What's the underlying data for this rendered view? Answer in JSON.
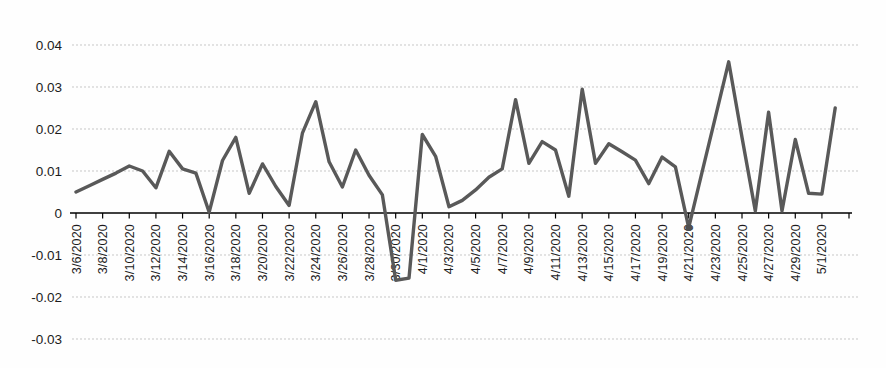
{
  "chart_data": {
    "type": "line",
    "title": "",
    "xlabel": "",
    "ylabel": "",
    "legend": "none",
    "grid": "horizontal-dashed",
    "line_color": "#595959",
    "axis_color": "#000000",
    "grid_color": "#c7c7c7",
    "ylim": [
      -0.03,
      0.04
    ],
    "y_tick_values": [
      0.04,
      0.03,
      0.02,
      0.01,
      0,
      -0.01,
      -0.02,
      -0.03
    ],
    "y_tick_labels": [
      "0.04",
      "0.03",
      "0.02",
      "0.01",
      "0",
      "-0.01",
      "-0.02",
      "-0.03"
    ],
    "x_tick_labels": [
      "3/6/2020",
      "3/8/2020",
      "3/10/2020",
      "3/12/2020",
      "3/14/2020",
      "3/16/2020",
      "3/18/2020",
      "3/20/2020",
      "3/22/2020",
      "3/24/2020",
      "3/26/2020",
      "3/28/2020",
      "3/30/2020",
      "4/1/2020",
      "4/3/2020",
      "4/5/2020",
      "4/7/2020",
      "4/9/2020",
      "4/11/2020",
      "4/13/2020",
      "4/15/2020",
      "4/17/2020",
      "4/19/2020",
      "4/21/2020",
      "4/23/2020",
      "4/25/2020",
      "4/27/2020",
      "4/29/2020",
      "5/1/2020"
    ],
    "x": [
      "3/6/2020",
      "3/7/2020",
      "3/8/2020",
      "3/9/2020",
      "3/10/2020",
      "3/11/2020",
      "3/12/2020",
      "3/13/2020",
      "3/14/2020",
      "3/15/2020",
      "3/16/2020",
      "3/17/2020",
      "3/18/2020",
      "3/19/2020",
      "3/20/2020",
      "3/21/2020",
      "3/22/2020",
      "3/23/2020",
      "3/24/2020",
      "3/25/2020",
      "3/26/2020",
      "3/27/2020",
      "3/28/2020",
      "3/29/2020",
      "3/30/2020",
      "3/31/2020",
      "4/1/2020",
      "4/2/2020",
      "4/3/2020",
      "4/4/2020",
      "4/5/2020",
      "4/6/2020",
      "4/7/2020",
      "4/8/2020",
      "4/9/2020",
      "4/10/2020",
      "4/11/2020",
      "4/12/2020",
      "4/13/2020",
      "4/14/2020",
      "4/15/2020",
      "4/16/2020",
      "4/17/2020",
      "4/18/2020",
      "4/19/2020",
      "4/20/2020",
      "4/21/2020",
      "4/22/2020",
      "4/23/2020",
      "4/24/2020",
      "4/25/2020",
      "4/26/2020",
      "4/27/2020",
      "4/28/2020",
      "4/29/2020",
      "4/30/2020",
      "5/1/2020",
      "5/2/2020"
    ],
    "values": [
      0.005,
      0.0065,
      0.008,
      0.0095,
      0.0112,
      0.01,
      0.006,
      0.0147,
      0.0105,
      0.0095,
      0.0002,
      0.0125,
      0.018,
      0.0047,
      0.0117,
      0.0063,
      0.0018,
      0.019,
      0.0265,
      0.0122,
      0.0062,
      0.015,
      0.009,
      0.0043,
      -0.016,
      -0.0155,
      0.0187,
      0.0135,
      0.0015,
      0.003,
      0.0055,
      0.0085,
      0.0105,
      0.027,
      0.0118,
      0.017,
      0.015,
      0.004,
      0.0295,
      0.0118,
      0.0165,
      0.0146,
      0.0126,
      0.007,
      0.0133,
      0.011,
      -0.0035,
      0.0097,
      0.0228,
      0.036,
      0.018,
      0.0005,
      0.024,
      0.0005,
      0.0175,
      0.0047,
      0.0045,
      0.025
    ],
    "marker_date": "4/21/2020"
  }
}
